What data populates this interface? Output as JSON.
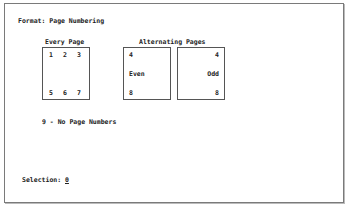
{
  "screen": {
    "title": "Format: Page Numbering",
    "every_page": {
      "heading": "Every Page",
      "top": [
        "1",
        "2",
        "3"
      ],
      "bottom": [
        "5",
        "6",
        "7"
      ]
    },
    "alternating": {
      "heading": "Alternating Pages",
      "even": {
        "top": "4",
        "label": "Even",
        "bottom": "8"
      },
      "odd": {
        "top": "4",
        "label": "Odd",
        "bottom": "8"
      }
    },
    "no_numbers": "9 - No Page Numbers",
    "selection_label": "Selection:",
    "selection_value": "0"
  }
}
